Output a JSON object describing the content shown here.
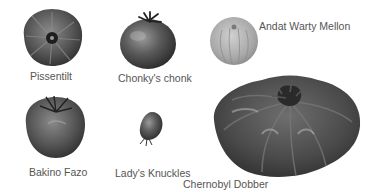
{
  "tomatoes": [
    {
      "name": "Pissentilt"
    },
    {
      "name": "Chonky's chonk"
    },
    {
      "name": "Andat Warty Mellon"
    },
    {
      "name": "Bakino Fazo"
    },
    {
      "name": "Lady's Knuckles"
    },
    {
      "name": "Chernobyl Dobber"
    }
  ],
  "colors": {
    "background": "#ffffff",
    "label": "#555555",
    "fruit_dark": "#3a3a3a",
    "fruit_mid": "#6a6a6a",
    "fruit_light": "#b5b5b5"
  }
}
